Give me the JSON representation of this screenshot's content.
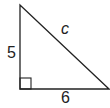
{
  "diagram": {
    "type": "right-triangle",
    "labels": {
      "vertical_leg": "5",
      "horizontal_leg": "6",
      "hypotenuse": "c"
    },
    "right_angle_marker": true,
    "stroke_color": "#222222",
    "background": "#ffffff"
  }
}
